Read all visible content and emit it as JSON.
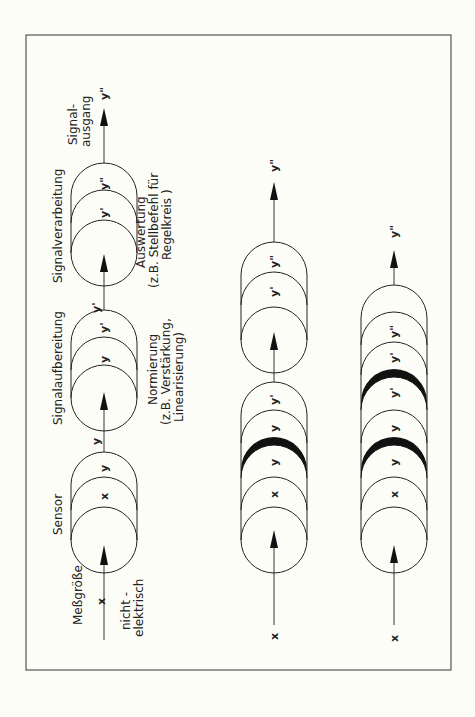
{
  "page": {
    "page_number": "3"
  },
  "figure": {
    "row1": {
      "input_symbol": "x",
      "input_label": "Meßgröße",
      "input_note_line1": "nicht -",
      "input_note_line2": "elektrisch",
      "stage1": {
        "title": "Sensor",
        "disks": [
          "x",
          "y"
        ],
        "output": "y"
      },
      "stage2": {
        "title": "Signalaufbereitung",
        "disks": [
          "y",
          "y'"
        ],
        "output": "y'",
        "note_line1": "Normierung",
        "note_line2": "(z.B. Verstärkung,",
        "note_line3": "Linearisierung)"
      },
      "stage3": {
        "title": "Signalverarbeitung",
        "disks": [
          "y'",
          "y\""
        ],
        "output": "y\"",
        "note_line1": "Auswertung",
        "note_line2": "(z.B. Stellbefehl für",
        "note_line3": "Regelkreis )"
      },
      "output_label_line1": "Signal-",
      "output_label_line2": "ausgang",
      "output_symbol": "y\""
    },
    "row2": {
      "input_symbol": "x",
      "block1_disks": [
        "x",
        "y",
        "y",
        "y'"
      ],
      "block1_black_separators": [
        1
      ],
      "block2_disks": [
        "y'",
        "y\""
      ],
      "output_symbol": "y\""
    },
    "row3": {
      "input_symbol": "x",
      "block_disks": [
        "x",
        "y",
        "y",
        "y'",
        "y'",
        "y\""
      ],
      "block_black_separators": [
        1,
        3
      ],
      "output_symbol": "y\""
    }
  }
}
